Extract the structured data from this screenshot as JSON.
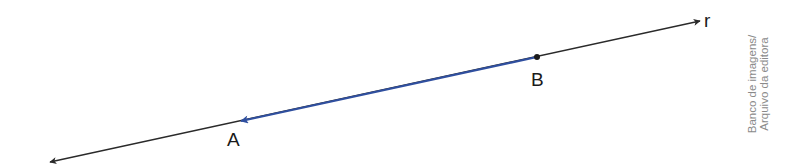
{
  "diagram": {
    "line_label": "r",
    "point_a_label": "A",
    "point_b_label": "B",
    "colors": {
      "line": "#2a2a2a",
      "vector": "#2f4f9f",
      "label": "#1a1a1a",
      "credit": "#8a8a8a"
    },
    "geometry": {
      "line_start": [
        50,
        162
      ],
      "line_end": [
        700,
        21
      ],
      "point_a": [
        240,
        121
      ],
      "point_b": [
        537,
        57
      ]
    }
  },
  "credit": {
    "line1": "Banco de imagens/",
    "line2": "Arquivo da editora"
  }
}
